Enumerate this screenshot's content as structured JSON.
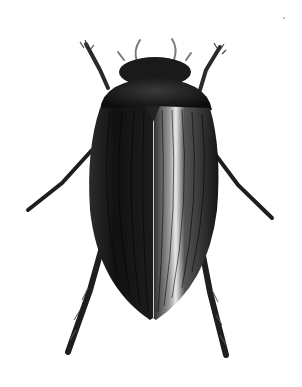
{
  "image": {
    "subject": "beetle-illustration",
    "description": "Dorsal view of a dark, glossy diving beetle with striated elytra",
    "background": "#ffffff",
    "colors": {
      "body": "#111111",
      "highlight": "#e8e8e8",
      "legs": "#2a2a2a",
      "antennae": "#7a7a7a"
    }
  }
}
